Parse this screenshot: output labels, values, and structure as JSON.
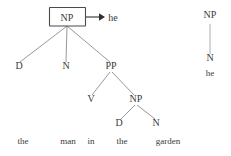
{
  "figure": {
    "background_color": "#ffffff",
    "text_color": "#3a3a3a",
    "line_color": "#6b6b6b",
    "box_border_color": "#4a4a4a",
    "arrow_color": "#2f2f2f"
  },
  "main_tree": {
    "root": {
      "label": "NP",
      "boxed": true,
      "x": 67,
      "y": 21
    },
    "level2": [
      {
        "label": "D",
        "x": 19,
        "y": 69
      },
      {
        "label": "N",
        "x": 66,
        "y": 69
      },
      {
        "label": "PP",
        "x": 111,
        "y": 69
      }
    ],
    "level3": [
      {
        "label": "V",
        "x": 91,
        "y": 102
      },
      {
        "label": "NP",
        "x": 136,
        "y": 102
      }
    ],
    "level4": [
      {
        "label": "D",
        "x": 119,
        "y": 126
      },
      {
        "label": "N",
        "x": 156,
        "y": 126
      }
    ],
    "words": [
      {
        "text": "the",
        "x": 23,
        "y": 144
      },
      {
        "text": "man",
        "x": 68,
        "y": 144
      },
      {
        "text": "in",
        "x": 91,
        "y": 144
      },
      {
        "text": "the",
        "x": 122,
        "y": 144
      },
      {
        "text": "garden",
        "x": 168,
        "y": 144
      }
    ]
  },
  "arrow": {
    "target_word": "he",
    "target_x": 113,
    "target_y": 21,
    "from_x": 86,
    "to_x": 104,
    "y": 17
  },
  "side_tree": {
    "nodes": [
      {
        "label": "NP",
        "x": 210,
        "y": 18
      },
      {
        "label": "N",
        "x": 210,
        "y": 61
      }
    ],
    "word": {
      "text": "he",
      "x": 210,
      "y": 76
    }
  }
}
